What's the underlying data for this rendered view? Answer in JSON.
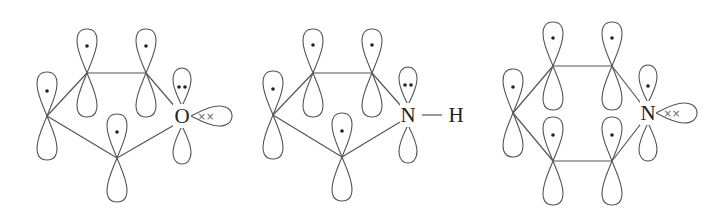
{
  "diagram": {
    "molecules": [
      {
        "id": "furan",
        "heteroatom_label": "O",
        "heteroatom_pz_electrons": "••",
        "lone_pair_sp2": "××",
        "ring_size": 5,
        "carbon_p_electrons": "•"
      },
      {
        "id": "pyrrole",
        "heteroatom_label": "N",
        "heteroatom_pz_electrons": "••",
        "substituent_label": "H",
        "bond_symbol": "—",
        "ring_size": 5,
        "carbon_p_electrons": "•"
      },
      {
        "id": "pyridine",
        "heteroatom_label": "N",
        "heteroatom_pz_electrons": "•",
        "lone_pair_sp2": "××",
        "ring_size": 6,
        "carbon_p_electrons": "•"
      }
    ]
  }
}
